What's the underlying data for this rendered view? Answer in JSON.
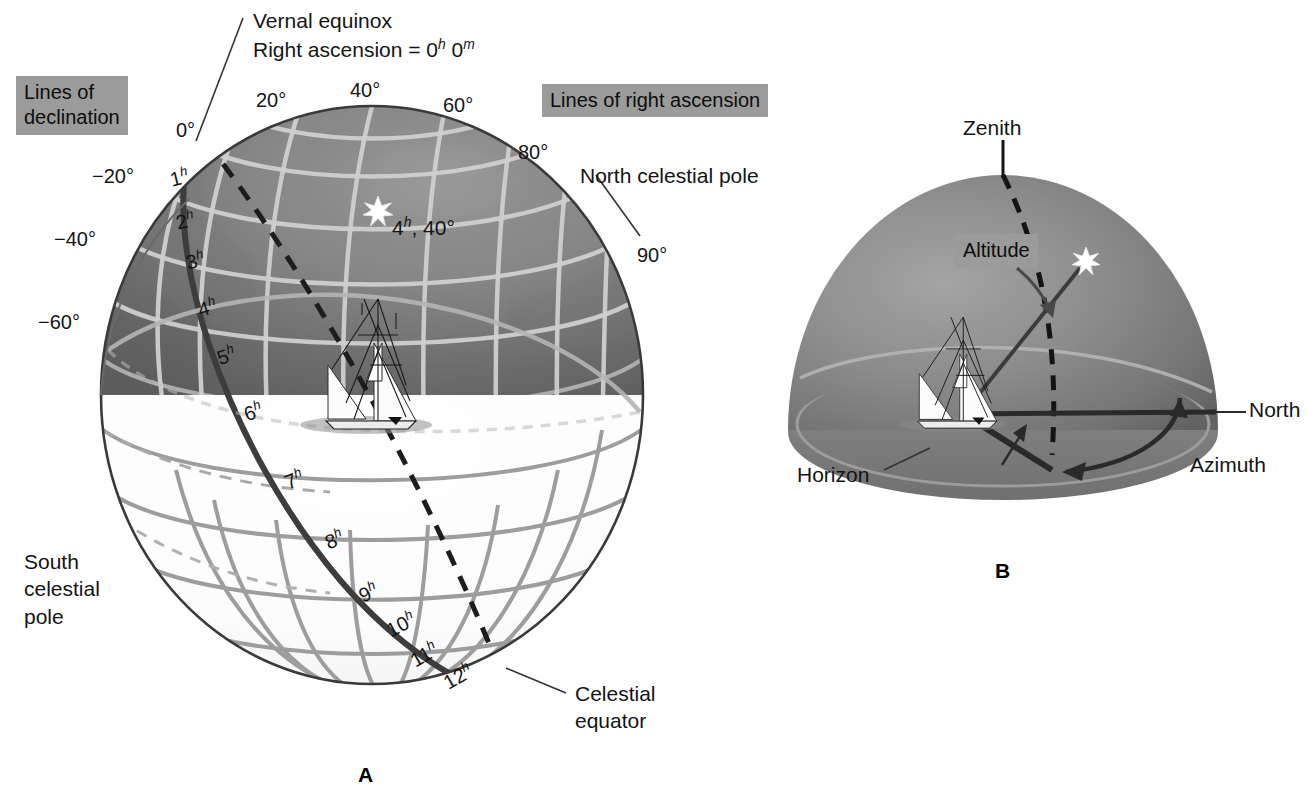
{
  "figure": {
    "panels": [
      {
        "id": "A",
        "letter": "A"
      },
      {
        "id": "B",
        "letter": "B"
      }
    ]
  },
  "panelA": {
    "letter": "A",
    "boxes": {
      "declination": "Lines of\ndeclination",
      "declination_line1": "Lines of",
      "declination_line2": "declination",
      "right_ascension": "Lines of right ascension"
    },
    "callouts": {
      "vernal_line1": "Vernal equinox",
      "vernal_line2_pre": "Right ascension = 0",
      "vernal_line2_h": "h",
      "vernal_line2_mid": " 0",
      "vernal_line2_m": "m",
      "vernal_full": "Right ascension = 0h 0m",
      "north_pole": "North celestial pole",
      "south_pole_line1": "South",
      "south_pole_line2": "celestial",
      "south_pole_line3": "pole",
      "celestial_equator_line1": "Celestial",
      "celestial_equator_line2": "equator",
      "star_label_pre": "4",
      "star_label_h": "h",
      "star_label_post": ", 40°",
      "star_label_full": "4h, 40°"
    },
    "declination_ticks": [
      {
        "value": "0°",
        "x": 176,
        "y": 118
      },
      {
        "value": "20°",
        "x": 256,
        "y": 88
      },
      {
        "value": "40°",
        "x": 350,
        "y": 78
      },
      {
        "value": "60°",
        "x": 443,
        "y": 93
      },
      {
        "value": "80°",
        "x": 518,
        "y": 140
      },
      {
        "value": "90°",
        "x": 637,
        "y": 243
      },
      {
        "value": "−20°",
        "x": 92,
        "y": 164
      },
      {
        "value": "−40°",
        "x": 54,
        "y": 227
      },
      {
        "value": "−60°",
        "x": 38,
        "y": 310
      }
    ],
    "right_ascension_hours": [
      {
        "value": "1",
        "sup": "h",
        "x": 170,
        "y": 165
      },
      {
        "value": "2",
        "sup": "h",
        "x": 176,
        "y": 208
      },
      {
        "value": "3",
        "sup": "h",
        "x": 186,
        "y": 248
      },
      {
        "value": "4",
        "sup": "h",
        "x": 198,
        "y": 295
      },
      {
        "value": "5",
        "sup": "h",
        "x": 217,
        "y": 343
      },
      {
        "value": "6",
        "sup": "h",
        "x": 244,
        "y": 399
      },
      {
        "value": "7",
        "sup": "h",
        "x": 285,
        "y": 467
      },
      {
        "value": "8",
        "sup": "h",
        "x": 325,
        "y": 527
      },
      {
        "value": "9",
        "sup": "h",
        "x": 359,
        "y": 580
      },
      {
        "value": "10",
        "sup": "h",
        "x": 386,
        "y": 612
      },
      {
        "value": "11",
        "sup": "h",
        "x": 410,
        "y": 642
      },
      {
        "value": "12",
        "sup": "h",
        "x": 443,
        "y": 664
      }
    ]
  },
  "panelB": {
    "letter": "B",
    "labels": {
      "zenith": "Zenith",
      "altitude": "Altitude",
      "horizon": "Horizon",
      "north": "North",
      "azimuth": "Azimuth"
    }
  },
  "colors": {
    "label_box_gray": "#9b9b9b",
    "sphere_upper_dark": "#6f6f6f",
    "sphere_upper_mid": "#838383",
    "sphere_lower_light": "#fbfbfb",
    "grid_light": "#d6d6d6",
    "grid_dark": "#8c8c8c",
    "outline": "#2b2b2b",
    "text": "#141414",
    "star": "#ffffff",
    "background": "#ffffff"
  }
}
